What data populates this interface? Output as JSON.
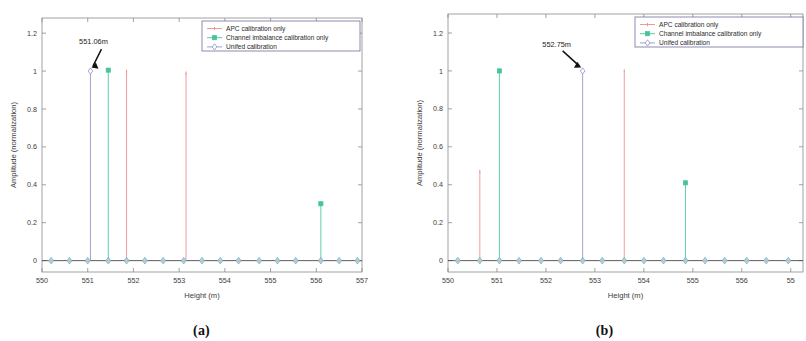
{
  "figure": {
    "panels": [
      {
        "id": "a",
        "caption": "(a)",
        "annotation": {
          "text": "551.06m",
          "x": 551.06,
          "y": 1.0
        },
        "chart_data": {
          "type": "scatter",
          "title": "",
          "xlabel": "Height (m)",
          "ylabel": "Amplitude (normalization)",
          "xlim": [
            550,
            557
          ],
          "ylim": [
            -0.06,
            1.28
          ],
          "xticks": [
            550,
            551,
            552,
            553,
            554,
            555,
            556,
            557
          ],
          "yticks": [
            0,
            0.2,
            0.4,
            0.6,
            0.8,
            1,
            1.2
          ],
          "ytick_labels": [
            "0",
            "0.2",
            "0.4",
            "0.6",
            "0.8",
            "1",
            "1.2"
          ],
          "xtick_labels": [
            "550",
            "551",
            "552",
            "553",
            "554",
            "555",
            "556",
            "557"
          ],
          "grid": false,
          "legend_position": "top-right",
          "baseline_x": [
            550.2,
            550.6,
            551.0,
            551.45,
            551.85,
            552.25,
            552.65,
            553.1,
            553.5,
            553.9,
            554.3,
            554.75,
            555.15,
            555.55,
            556.1,
            556.5,
            556.9
          ],
          "series": [
            {
              "name": "APC calibration only",
              "color": "#f08a8a",
              "marker": "dot",
              "stems": [
                {
                  "x": 551.85,
                  "y": 1.0
                },
                {
                  "x": 553.15,
                  "y": 0.99
                }
              ]
            },
            {
              "name": "Channel imbalance calibration only",
              "color": "#45c49a",
              "marker": "square",
              "stems": [
                {
                  "x": 551.45,
                  "y": 1.005
                },
                {
                  "x": 556.1,
                  "y": 0.3
                }
              ]
            },
            {
              "name": "Unifed calibration",
              "color": "#8f93c8",
              "marker": "diamond",
              "stems": [
                {
                  "x": 551.06,
                  "y": 1.0
                }
              ]
            }
          ]
        }
      },
      {
        "id": "b",
        "caption": "(b)",
        "annotation": {
          "text": "552.75m",
          "x": 552.75,
          "y": 1.0
        },
        "chart_data": {
          "type": "scatter",
          "title": "",
          "xlabel": "Height (m)",
          "ylabel": "Amplitude (normalization)",
          "xlim": [
            550,
            557.25
          ],
          "ylim": [
            -0.06,
            1.3
          ],
          "xticks": [
            550,
            551,
            552,
            553,
            554,
            555,
            556,
            557
          ],
          "yticks": [
            0,
            0.2,
            0.4,
            0.6,
            0.8,
            1,
            1.2
          ],
          "ytick_labels": [
            "0",
            "0.2",
            "0.4",
            "0.6",
            "0.8",
            "1",
            "1.2"
          ],
          "xtick_labels": [
            "550",
            "551",
            "552",
            "553",
            "554",
            "555",
            "556",
            "55"
          ],
          "grid": false,
          "legend_position": "top-right",
          "baseline_x": [
            550.2,
            550.65,
            551.05,
            551.45,
            551.9,
            552.3,
            552.75,
            553.15,
            553.6,
            554.0,
            554.4,
            554.85,
            555.25,
            555.65,
            556.1,
            556.5,
            556.95
          ],
          "series": [
            {
              "name": "APC calibration only",
              "color": "#f08a8a",
              "marker": "dot",
              "stems": [
                {
                  "x": 550.65,
                  "y": 0.47
                },
                {
                  "x": 553.6,
                  "y": 1.0
                }
              ]
            },
            {
              "name": "Channel imbalance calibration only",
              "color": "#45c49a",
              "marker": "square",
              "stems": [
                {
                  "x": 551.05,
                  "y": 1.0
                },
                {
                  "x": 554.85,
                  "y": 0.41
                }
              ]
            },
            {
              "name": "Unifed calibration",
              "color": "#8f93c8",
              "marker": "diamond",
              "stems": [
                {
                  "x": 552.75,
                  "y": 1.0
                }
              ]
            }
          ]
        }
      }
    ]
  }
}
